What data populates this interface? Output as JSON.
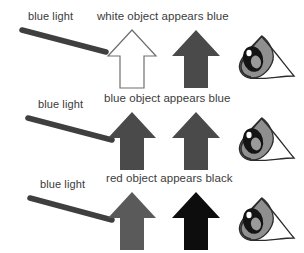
{
  "diagram": {
    "palette": {
      "background": "#ffffff",
      "text": "#3a3a3a",
      "beam": "#3f3f3f",
      "outline_stroke": "#6e6e6e",
      "white_fill": "#ffffff",
      "blue_object_fill": "#4a4a4a",
      "red_object_fill": "#5a5a5a",
      "black_fill": "#0d0d0d",
      "eye_outline": "#2b2b2b",
      "eye_iris": "#141414",
      "eye_sclera": "#8f8f8f"
    },
    "rows": [
      {
        "id": "row-white-object",
        "beam_label": "blue light",
        "caption": "white object appears blue",
        "object_arrow": {
          "name": "white-object-arrow",
          "fill": "#ffffff",
          "stroke": "#6e6e6e",
          "semantic": "white object"
        },
        "perceived_arrow": {
          "name": "perceived-blue-arrow",
          "fill": "#4a4a4a",
          "stroke": "none",
          "semantic": "appears blue"
        },
        "eye": {
          "name": "eye-icon",
          "semantic": "observer eye"
        }
      },
      {
        "id": "row-blue-object",
        "beam_label": "blue light",
        "caption": "blue object appears blue",
        "object_arrow": {
          "name": "blue-object-arrow",
          "fill": "#4a4a4a",
          "stroke": "none",
          "semantic": "blue object"
        },
        "perceived_arrow": {
          "name": "perceived-blue-arrow",
          "fill": "#4a4a4a",
          "stroke": "none",
          "semantic": "appears blue"
        },
        "eye": {
          "name": "eye-icon",
          "semantic": "observer eye"
        }
      },
      {
        "id": "row-red-object",
        "beam_label": "blue light",
        "caption": "red object appears black",
        "object_arrow": {
          "name": "red-object-arrow",
          "fill": "#5a5a5a",
          "stroke": "none",
          "semantic": "red object"
        },
        "perceived_arrow": {
          "name": "perceived-black-arrow",
          "fill": "#0d0d0d",
          "stroke": "none",
          "semantic": "appears black"
        },
        "eye": {
          "name": "eye-icon",
          "semantic": "observer eye"
        }
      }
    ]
  }
}
